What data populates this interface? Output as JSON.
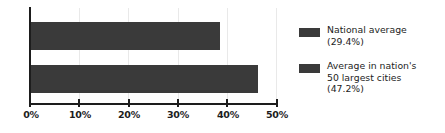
{
  "chart_data": {
    "type": "bar",
    "orientation": "horizontal",
    "title": "",
    "xlabel": "",
    "ylabel": "",
    "xlim": [
      0,
      50
    ],
    "grid": true,
    "legend_position": "right",
    "categories": [
      "National average",
      "Average in nation's 50 largest cities"
    ],
    "values": [
      38.5,
      46.2
    ],
    "tick_labels": [
      "0%",
      "10%",
      "20%",
      "30%",
      "40%",
      "50%"
    ],
    "tick_values": [
      0,
      10,
      20,
      30,
      40,
      50
    ],
    "bar_color": "#3a3a3a",
    "grid_color": "#e9e9e9",
    "axis_color": "#1d1d1d",
    "background": "#ffffff",
    "series": [
      {
        "name": "National average",
        "value": 38.5,
        "label": "(29.4%)"
      },
      {
        "name": "Average in nation's 50 largest cities",
        "value": 46.2,
        "label": "(47.2%)"
      }
    ]
  },
  "legend": {
    "items": [
      {
        "swatch_color": "#3a3a3a",
        "text": "National average\n(29.4%)",
        "name": "National average",
        "value": "(29.4%)"
      },
      {
        "swatch_color": "#3a3a3a",
        "text": "Average in nation's\n50 largest cities\n(47.2%)",
        "name": "Average in nation's 50 largest cities",
        "value": "(47.2%)"
      }
    ]
  },
  "axis": {
    "ticks": [
      {
        "label": "0%",
        "value": 0
      },
      {
        "label": "10%",
        "value": 10
      },
      {
        "label": "20%",
        "value": 20
      },
      {
        "label": "30%",
        "value": 30
      },
      {
        "label": "40%",
        "value": 40
      },
      {
        "label": "50%",
        "value": 50
      }
    ]
  }
}
